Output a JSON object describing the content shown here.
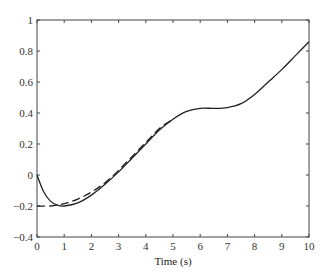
{
  "chart_data": {
    "type": "line",
    "title": "",
    "xlabel": "Time (s)",
    "ylabel": "",
    "xlim": [
      0,
      10
    ],
    "ylim": [
      -0.4,
      1
    ],
    "grid": false,
    "legend": null,
    "x_ticks": [
      "0",
      "1",
      "2",
      "3",
      "4",
      "5",
      "6",
      "7",
      "8",
      "9",
      "10"
    ],
    "y_ticks": [
      "-0.4",
      "-0.2",
      "0",
      "0.2",
      "0.4",
      "0.6",
      "0.8",
      "1"
    ],
    "series": [
      {
        "name": "solid",
        "style": "solid",
        "color": "#222222",
        "x": [
          0,
          0.25,
          0.5,
          0.75,
          1,
          1.5,
          2,
          2.5,
          3,
          3.5,
          4,
          4.5,
          5,
          5.5,
          6,
          6.5,
          7,
          7.5,
          8,
          8.5,
          9,
          9.5,
          10
        ],
        "y": [
          0.0,
          -0.11,
          -0.17,
          -0.195,
          -0.2,
          -0.18,
          -0.13,
          -0.06,
          0.02,
          0.11,
          0.2,
          0.29,
          0.36,
          0.41,
          0.43,
          0.43,
          0.435,
          0.46,
          0.52,
          0.6,
          0.68,
          0.77,
          0.86
        ]
      },
      {
        "name": "dashed",
        "style": "dashed",
        "color": "#222222",
        "x": [
          0,
          0.5,
          1,
          1.5,
          2,
          2.5,
          3,
          3.5,
          4,
          4.5,
          5
        ],
        "y": [
          -0.2,
          -0.2,
          -0.185,
          -0.155,
          -0.11,
          -0.05,
          0.03,
          0.12,
          0.21,
          0.3,
          0.36
        ]
      }
    ]
  }
}
